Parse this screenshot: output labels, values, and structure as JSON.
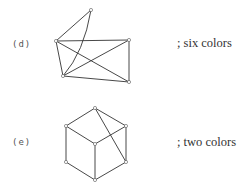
{
  "figures": [
    {
      "id": "d",
      "label": "(d)",
      "caption": "; six colors",
      "vertices": {
        "top": [
          91,
          10
        ],
        "upper_left": [
          56,
          41
        ],
        "upper_right": [
          129,
          40
        ],
        "lower_left": [
          63,
          76
        ],
        "lower_right": [
          129,
          82
        ]
      },
      "edges": [
        [
          "top",
          "upper_left"
        ],
        [
          "top",
          "lower_left"
        ],
        [
          "upper_left",
          "upper_right"
        ],
        [
          "upper_left",
          "lower_left"
        ],
        [
          "upper_left",
          "lower_right"
        ],
        [
          "lower_left",
          "upper_right"
        ],
        [
          "lower_left",
          "lower_right"
        ],
        [
          "upper_right",
          "lower_right"
        ]
      ]
    },
    {
      "id": "e",
      "label": "(e)",
      "caption": "; two colors",
      "vertices": {
        "top": [
          95,
          108
        ],
        "upper_left": [
          66,
          126
        ],
        "upper_right": [
          126,
          126
        ],
        "center": [
          95,
          144
        ],
        "lower_left": [
          66,
          162
        ],
        "lower_right": [
          126,
          162
        ],
        "bottom": [
          95,
          180
        ]
      },
      "edges": [
        [
          "top",
          "upper_left"
        ],
        [
          "top",
          "upper_right"
        ],
        [
          "upper_left",
          "center"
        ],
        [
          "upper_right",
          "center"
        ],
        [
          "upper_left",
          "lower_left"
        ],
        [
          "upper_right",
          "lower_right"
        ],
        [
          "center",
          "bottom"
        ],
        [
          "lower_left",
          "bottom"
        ],
        [
          "lower_right",
          "bottom"
        ],
        [
          "top",
          "lower_right"
        ]
      ]
    }
  ]
}
